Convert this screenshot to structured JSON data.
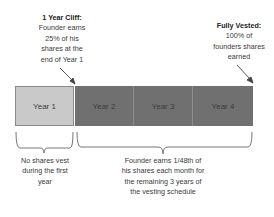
{
  "cliff_note": {
    "title": "1 Year Cliff:",
    "lines": [
      "Founder earns",
      "25% of his",
      "shares at the",
      "end of Year 1"
    ]
  },
  "vested_note": {
    "title": "Fully Vested:",
    "lines": [
      "100% of",
      "founders shares",
      "earned"
    ]
  },
  "timeline": {
    "years": [
      {
        "label": "Year 1",
        "color": "#c9c9c9"
      },
      {
        "label": "Year 2",
        "color": "#707070"
      },
      {
        "label": "Year 3",
        "color": "#707070"
      },
      {
        "label": "Year 4",
        "color": "#707070"
      }
    ]
  },
  "first_year_note": {
    "lines": [
      "No shares vest",
      "during the first",
      "year"
    ]
  },
  "remaining_note": {
    "lines": [
      "Founder earns 1/48th of",
      "his shares each month for",
      "the remaining 3 years of",
      "the vesting schedule"
    ]
  }
}
